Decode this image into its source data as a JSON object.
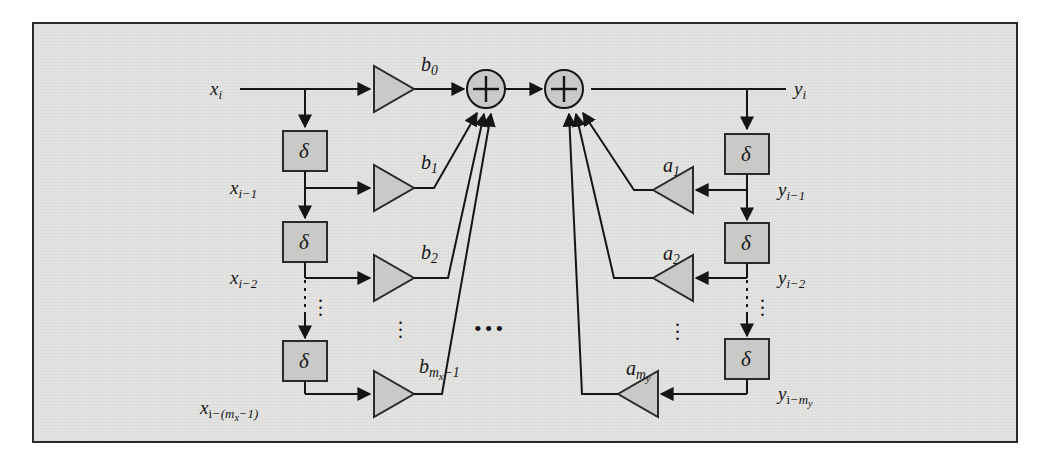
{
  "figure": {
    "kind": "signal-flow-diagram",
    "frame": {
      "background_color": "#e3e3e1",
      "border_color": "#2a2a2a",
      "page_background": "#ffffff"
    },
    "style": {
      "line_color": "#151515",
      "block_fill": "#c9c9c7",
      "block_stroke": "#2a2a2a"
    }
  },
  "labels": {
    "input": "x",
    "input_sub": "i",
    "output": "y",
    "output_sub": "i",
    "delay_symbol": "δ",
    "sum_symbol": "+"
  },
  "feedforward": {
    "branch_label": "b",
    "taps": [
      {
        "coef": "b",
        "coef_sub": "0",
        "signal": "x",
        "signal_sub": "i"
      },
      {
        "coef": "b",
        "coef_sub": "1",
        "signal": "x",
        "signal_sub": "i−1"
      },
      {
        "coef": "b",
        "coef_sub": "2",
        "signal": "x",
        "signal_sub": "i−2"
      },
      {
        "coef": "b",
        "coef_sub": "m_x−1",
        "signal": "x",
        "signal_sub": "i−(m_x−1)"
      }
    ]
  },
  "feedback": {
    "branch_label": "a",
    "taps": [
      {
        "coef": "a",
        "coef_sub": "1",
        "signal": "y",
        "signal_sub": "i−1"
      },
      {
        "coef": "a",
        "coef_sub": "2",
        "signal": "y",
        "signal_sub": "i−2"
      },
      {
        "coef": "a",
        "coef_sub": "m_y",
        "signal": "y",
        "signal_sub": "i−m_y"
      }
    ]
  },
  "ellipses": {
    "horizontal_center": "•••",
    "vertical": "⋮"
  },
  "delay_blocks": {
    "left_count": 3,
    "right_count": 3,
    "symbol": "δ"
  },
  "summers": {
    "count": 2,
    "symbol": "+"
  }
}
